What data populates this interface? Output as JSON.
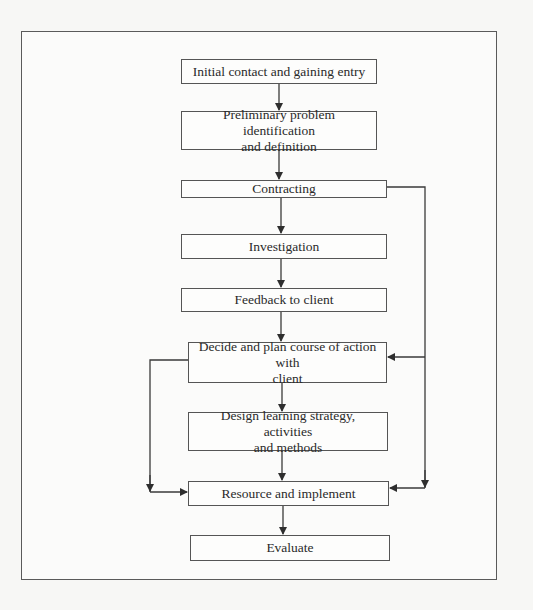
{
  "diagram": {
    "type": "flowchart",
    "nodes": [
      {
        "id": "n1",
        "label": "Initial contact and gaining entry"
      },
      {
        "id": "n2",
        "label": "Preliminary problem identification and definition"
      },
      {
        "id": "n3",
        "label": "Contracting"
      },
      {
        "id": "n4",
        "label": "Investigation"
      },
      {
        "id": "n5",
        "label": "Feedback to client"
      },
      {
        "id": "n6",
        "label": "Decide and plan course of action with client"
      },
      {
        "id": "n7",
        "label": "Design learning strategy, activities and methods"
      },
      {
        "id": "n8",
        "label": "Resource and implement"
      },
      {
        "id": "n9",
        "label": "Evaluate"
      }
    ],
    "edges": [
      {
        "from": "n1",
        "to": "n2"
      },
      {
        "from": "n2",
        "to": "n3"
      },
      {
        "from": "n3",
        "to": "n4"
      },
      {
        "from": "n4",
        "to": "n5"
      },
      {
        "from": "n5",
        "to": "n6"
      },
      {
        "from": "n6",
        "to": "n7"
      },
      {
        "from": "n7",
        "to": "n8"
      },
      {
        "from": "n8",
        "to": "n9"
      },
      {
        "from": "n3",
        "to": "n6",
        "route": "right-bypass"
      },
      {
        "from": "n3",
        "to": "n8",
        "route": "right-bypass"
      },
      {
        "from": "n6",
        "to": "n8",
        "route": "left-bypass"
      }
    ]
  },
  "boxes": {
    "b1": "Initial contact and gaining entry",
    "b2_line1": "Preliminary problem identification",
    "b2_line2": "and definition",
    "b3": "Contracting",
    "b4": "Investigation",
    "b5": "Feedback to client",
    "b6_line1": "Decide and plan course of action with",
    "b6_line2": "client",
    "b7_line1": "Design learning strategy, activities",
    "b7_line2": "and methods",
    "b8": "Resource and implement",
    "b9": "Evaluate"
  },
  "colors": {
    "line": "#3a3a3a",
    "box_border": "#555555",
    "background": "#f7f7f5"
  }
}
